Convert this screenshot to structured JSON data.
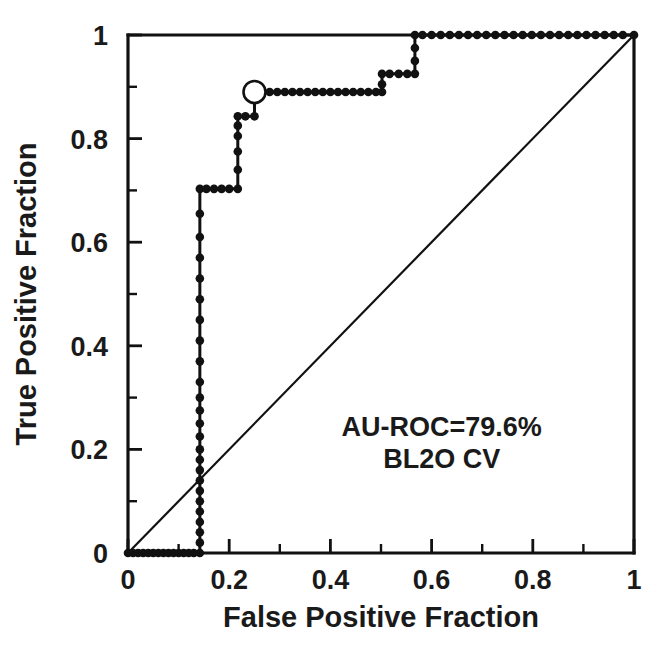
{
  "chart_data": {
    "type": "line",
    "title": "",
    "xlabel": "False Positive Fraction",
    "ylabel": "True Positive Fraction",
    "xlim": [
      0,
      1
    ],
    "ylim": [
      0,
      1
    ],
    "grid": false,
    "legend": "none",
    "xticks": [
      "0",
      "0.2",
      "0.4",
      "0.6",
      "0.8",
      "1"
    ],
    "xtick_values": [
      0,
      0.2,
      0.4,
      0.6,
      0.8,
      1
    ],
    "yticks": [
      "0",
      "0.2",
      "0.4",
      "0.6",
      "0.8",
      "1"
    ],
    "ytick_values": [
      0,
      0.2,
      0.4,
      0.6,
      0.8,
      1
    ],
    "minor_tick_values": [
      0.1,
      0.3,
      0.5,
      0.7,
      0.9
    ],
    "annotations": [
      {
        "text": "AU-ROC=79.6%",
        "x": 0.62,
        "ylevel": 0.225
      },
      {
        "text": "BL2O CV",
        "x": 0.62,
        "ylevel": 0.165
      }
    ],
    "series": [
      {
        "name": "ROC curve",
        "style": "step-markers",
        "color": "#111111",
        "x": [
          0.0,
          0.01,
          0.02,
          0.03,
          0.04,
          0.05,
          0.06,
          0.07,
          0.08,
          0.09,
          0.1,
          0.11,
          0.12,
          0.13,
          0.142,
          0.142,
          0.142,
          0.142,
          0.142,
          0.142,
          0.142,
          0.142,
          0.142,
          0.142,
          0.142,
          0.142,
          0.142,
          0.142,
          0.142,
          0.142,
          0.142,
          0.142,
          0.142,
          0.142,
          0.142,
          0.142,
          0.142,
          0.142,
          0.142,
          0.155,
          0.17,
          0.185,
          0.2,
          0.217,
          0.217,
          0.217,
          0.217,
          0.217,
          0.217,
          0.232,
          0.25,
          0.25,
          0.265,
          0.28,
          0.295,
          0.31,
          0.325,
          0.34,
          0.355,
          0.37,
          0.385,
          0.4,
          0.415,
          0.43,
          0.445,
          0.46,
          0.475,
          0.49,
          0.502,
          0.502,
          0.502,
          0.517,
          0.535,
          0.552,
          0.567,
          0.567,
          0.567,
          0.567,
          0.582,
          0.6,
          0.618,
          0.636,
          0.654,
          0.672,
          0.69,
          0.708,
          0.726,
          0.744,
          0.762,
          0.78,
          0.798,
          0.816,
          0.834,
          0.852,
          0.87,
          0.888,
          0.906,
          0.924,
          0.942,
          0.96,
          0.978,
          1.0
        ],
        "y": [
          0.0,
          0.0,
          0.0,
          0.0,
          0.0,
          0.0,
          0.0,
          0.0,
          0.0,
          0.0,
          0.0,
          0.0,
          0.0,
          0.0,
          0.0,
          0.02,
          0.04,
          0.06,
          0.08,
          0.1,
          0.12,
          0.14,
          0.16,
          0.18,
          0.2,
          0.225,
          0.25,
          0.275,
          0.3,
          0.33,
          0.37,
          0.41,
          0.45,
          0.49,
          0.53,
          0.57,
          0.61,
          0.655,
          0.703,
          0.703,
          0.703,
          0.703,
          0.703,
          0.703,
          0.74,
          0.775,
          0.805,
          0.825,
          0.843,
          0.843,
          0.843,
          0.89,
          0.89,
          0.89,
          0.89,
          0.89,
          0.89,
          0.89,
          0.89,
          0.89,
          0.89,
          0.89,
          0.89,
          0.89,
          0.89,
          0.89,
          0.89,
          0.89,
          0.89,
          0.905,
          0.925,
          0.925,
          0.925,
          0.925,
          0.925,
          0.95,
          0.975,
          1.0,
          1.0,
          1.0,
          1.0,
          1.0,
          1.0,
          1.0,
          1.0,
          1.0,
          1.0,
          1.0,
          1.0,
          1.0,
          1.0,
          1.0,
          1.0,
          1.0,
          1.0,
          1.0,
          1.0,
          1.0,
          1.0,
          1.0,
          1.0,
          1.0
        ]
      },
      {
        "name": "chance line",
        "style": "plain-line",
        "color": "#111111",
        "x": [
          0,
          1
        ],
        "y": [
          0,
          1
        ]
      }
    ],
    "operating_point": {
      "x": 0.25,
      "y": 0.89,
      "marker": "open-circle"
    }
  }
}
